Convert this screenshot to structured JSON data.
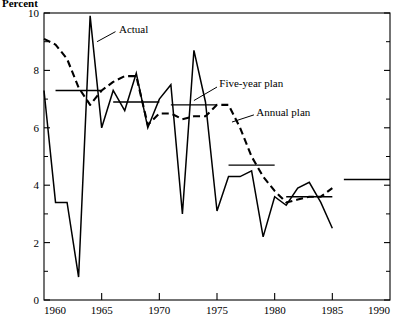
{
  "chart_data": {
    "type": "line",
    "title": "",
    "ylabel": "Percent",
    "xlabel": "",
    "xlim": [
      1960,
      1990
    ],
    "ylim": [
      0,
      10
    ],
    "grid": false,
    "legend_position": "inline-annotations",
    "y_ticks": [
      0,
      2,
      4,
      6,
      8,
      10
    ],
    "y_tick_labels": [
      "0",
      "2",
      "4",
      "6",
      "8",
      "10"
    ],
    "y_minor_ticks": [
      1,
      3,
      5,
      7,
      9
    ],
    "x_ticks": [
      1960,
      1965,
      1970,
      1975,
      1980,
      1985,
      1990
    ],
    "x_tick_labels": [
      "1960",
      "1965",
      "1970",
      "1975",
      "1980",
      "1985",
      "1990"
    ],
    "annotations": [
      {
        "text": "Actual",
        "x": 1966.5,
        "y": 9.45
      },
      {
        "text": "Five-year plan",
        "x": 1975.2,
        "y": 7.55
      },
      {
        "text": "Annual plan",
        "x": 1978.4,
        "y": 6.55
      }
    ],
    "series": [
      {
        "name": "Actual",
        "style": "solid",
        "x": [
          1960,
          1961,
          1962,
          1963,
          1964,
          1965,
          1966,
          1967,
          1968,
          1969,
          1970,
          1971,
          1972,
          1973,
          1974,
          1975,
          1976,
          1977,
          1978,
          1979,
          1980,
          1981,
          1982,
          1983,
          1984,
          1985
        ],
        "values": [
          7.3,
          3.4,
          3.4,
          0.8,
          9.9,
          6.0,
          7.3,
          6.6,
          7.9,
          6.0,
          7.0,
          7.5,
          3.0,
          8.7,
          6.9,
          3.1,
          4.3,
          4.3,
          4.5,
          2.2,
          3.6,
          3.3,
          3.9,
          4.1,
          3.4,
          2.5
        ]
      },
      {
        "name": "Annual plan",
        "style": "dashed",
        "x": [
          1960,
          1961,
          1962,
          1963,
          1964,
          1965,
          1966,
          1967,
          1968,
          1969,
          1970,
          1971,
          1972,
          1973,
          1974,
          1975,
          1976,
          1977,
          1978,
          1979,
          1980,
          1981,
          1982,
          1983,
          1984,
          1985
        ],
        "values": [
          9.1,
          8.9,
          8.4,
          7.4,
          6.8,
          7.3,
          7.6,
          7.8,
          7.8,
          6.1,
          6.5,
          6.5,
          6.3,
          6.4,
          6.4,
          6.8,
          6.8,
          6.0,
          5.0,
          4.3,
          3.8,
          3.4,
          3.5,
          3.6,
          3.6,
          3.9
        ]
      },
      {
        "name": "Five-year plan",
        "style": "step-segments",
        "segments": [
          {
            "x_start": 1961,
            "x_end": 1965,
            "value": 7.3
          },
          {
            "x_start": 1966,
            "x_end": 1970,
            "value": 6.9
          },
          {
            "x_start": 1971,
            "x_end": 1975,
            "value": 6.8
          },
          {
            "x_start": 1976,
            "x_end": 1980,
            "value": 4.7
          },
          {
            "x_start": 1981,
            "x_end": 1985,
            "value": 3.6
          },
          {
            "x_start": 1986,
            "x_end": 1990,
            "value": 4.2
          }
        ]
      }
    ]
  }
}
